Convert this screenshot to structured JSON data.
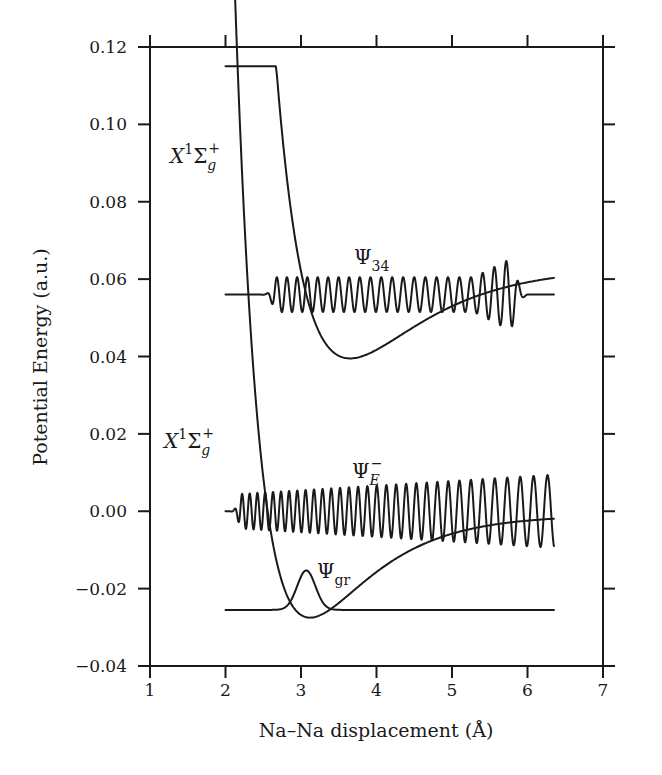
{
  "chart_data": {
    "type": "line",
    "title": "",
    "xlabel": "Na–Na displacement (Å)",
    "ylabel": "Potential Energy (a.u.)",
    "xlim": [
      1,
      7
    ],
    "ylim": [
      -0.04,
      0.12
    ],
    "xticks": [
      "1",
      "2",
      "3",
      "4",
      "5",
      "6",
      "7"
    ],
    "yticks": [
      "0.12",
      "0.10",
      "0.08",
      "0.06",
      "0.04",
      "0.02",
      "0.00",
      "−0.02",
      "−0.04"
    ],
    "grid": false,
    "legend": null,
    "series": [
      {
        "name": "X1Sigma_g+ (upper potential curve)",
        "x": [
          2.0,
          2.2,
          2.4,
          2.6,
          2.8,
          3.0,
          3.2,
          3.4,
          3.6,
          3.8,
          4.0,
          4.5,
          5.0,
          5.5,
          6.0,
          6.35
        ],
        "y": [
          0.113,
          0.095,
          0.08,
          0.067,
          0.057,
          0.049,
          0.044,
          0.041,
          0.0395,
          0.0397,
          0.041,
          0.046,
          0.052,
          0.057,
          0.061,
          0.063
        ]
      },
      {
        "name": "X1Sigma_g+ (lower potential curve)",
        "x": [
          2.0,
          2.2,
          2.4,
          2.6,
          2.8,
          3.0,
          3.2,
          3.4,
          3.6,
          3.8,
          4.0,
          4.5,
          5.0,
          5.5,
          6.0,
          6.35
        ],
        "y": [
          0.02,
          0.004,
          -0.008,
          -0.017,
          -0.023,
          -0.026,
          -0.0275,
          -0.0265,
          -0.024,
          -0.02,
          -0.016,
          -0.009,
          -0.0045,
          -0.0025,
          -0.0015,
          -0.001
        ]
      },
      {
        "name": "Psi_34 (baseline 0.056, ~22 oscillations from 2.7 to 5.7 Å)",
        "baseline": 0.056,
        "x_range": [
          2.0,
          6.35
        ]
      },
      {
        "name": "Psi_E- (baseline 0.0, oscillations increasing in wavelength and amplitude from 2.2 to 6.35 Å)",
        "baseline": 0.0,
        "x_range": [
          2.0,
          6.35
        ]
      },
      {
        "name": "Psi_gr (Gaussian peak at ~3.07 Å, baseline −0.0255, peak −0.0155)",
        "baseline": -0.0255,
        "peak_x": 3.07,
        "peak_y": -0.0155,
        "x_range": [
          2.0,
          6.35
        ]
      }
    ],
    "annotations": [
      {
        "text": "X¹Σg⁺",
        "x": 1.3,
        "y": 0.102
      },
      {
        "text": "Ψ34",
        "x": 3.55,
        "y": 0.062
      },
      {
        "text": "X¹Σg⁺",
        "x": 1.2,
        "y": 0.015
      },
      {
        "text": "ΨE⁻",
        "x": 3.6,
        "y": 0.006
      },
      {
        "text": "Ψgr",
        "x": 3.25,
        "y": -0.015
      }
    ]
  },
  "axes": {
    "xlabel": "Na–Na displacement (Å)",
    "ylabel": "Potential Energy (a.u.)",
    "xticks": [
      "1",
      "2",
      "3",
      "4",
      "5",
      "6",
      "7"
    ],
    "yticks": [
      "0.12",
      "0.10",
      "0.08",
      "0.06",
      "0.04",
      "0.02",
      "0.00",
      "−0.02",
      "−0.04"
    ]
  },
  "labels": {
    "state_X": "X",
    "state_sup1": "1",
    "state_sigma": "Σ",
    "state_g": "g",
    "state_plus": "+",
    "psi": "Ψ",
    "psi34_sub": "34",
    "psiE_sub": "E",
    "psiE_sup": "−",
    "psigr_sub": "gr"
  }
}
